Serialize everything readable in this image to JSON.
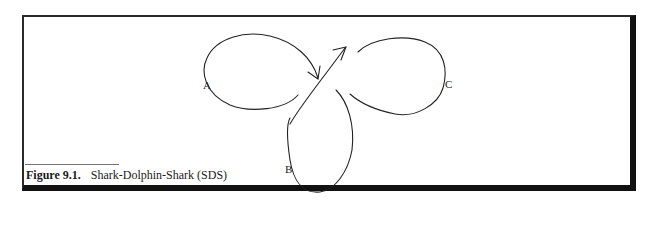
{
  "figure": {
    "number_label": "Figure 9.1.",
    "title": "Shark-Dolphin-Shark (SDS)"
  },
  "diagram": {
    "loop_labels": [
      "A",
      "B",
      "C"
    ],
    "stroke_color": "#222222"
  }
}
